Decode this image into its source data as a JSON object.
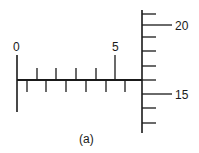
{
  "diagram": {
    "type": "micrometer-scale-reading",
    "caption": "(a)",
    "sleeve": {
      "labels": [
        {
          "text": "0",
          "x": 17
        },
        {
          "text": "5",
          "x": 115
        }
      ]
    },
    "thimble": {
      "labels": [
        {
          "text": "20",
          "y": 25
        },
        {
          "text": "15",
          "y": 94
        }
      ]
    },
    "colors": {
      "line": "#1a1a1a",
      "background": "#ffffff"
    }
  }
}
